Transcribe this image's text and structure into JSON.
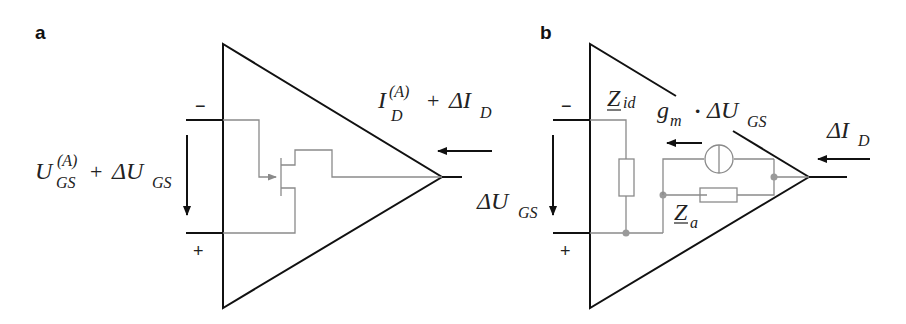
{
  "figure": {
    "panels": [
      {
        "id": "a",
        "label": "a",
        "input_minus": "−",
        "input_plus": "+",
        "input_voltage": {
          "base": "U",
          "sup": "(A)",
          "sub": "GS",
          "plus": "+",
          "delta": "ΔU",
          "sub2": "GS"
        },
        "output_current": {
          "base": "I",
          "sup": "(A)",
          "sub": "D",
          "plus": "+",
          "delta": "ΔI",
          "sub2": "D"
        },
        "inner_element": "FET transistor symbol"
      },
      {
        "id": "b",
        "label": "b",
        "input_minus": "−",
        "input_plus": "+",
        "input_voltage": {
          "delta": "ΔU",
          "sub": "GS"
        },
        "input_impedance": {
          "base": "Z",
          "sub": "id"
        },
        "current_source": {
          "g": "g",
          "gsub": "m",
          "dot": "·",
          "delta": "ΔU",
          "sub": "GS"
        },
        "output_impedance": {
          "base": "Z",
          "sub": "a"
        },
        "output_current": {
          "delta": "ΔI",
          "sub": "D"
        }
      }
    ],
    "colors": {
      "main_line": "#111111",
      "inner_line": "#8a8a8a",
      "node": "#9a9a9a",
      "background": "#ffffff"
    }
  }
}
